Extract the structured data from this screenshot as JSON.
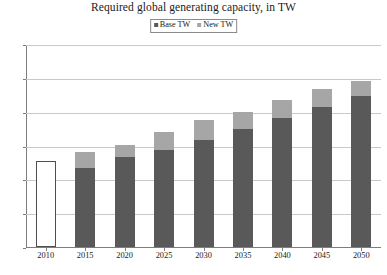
{
  "chart_data": {
    "type": "bar",
    "subtype": "stacked-column",
    "title": "Required global generating capacity, in TW",
    "xlabel": "",
    "ylabel": "",
    "ylim": [
      0,
      12
    ],
    "yticks": [
      0,
      2,
      4,
      6,
      8,
      10,
      12
    ],
    "ytick_labels": [
      "0",
      "2",
      "4",
      "6",
      "8",
      "10",
      "12"
    ],
    "grid": true,
    "legend_position": "top-center",
    "categories": [
      "2010",
      "2015",
      "2020",
      "2025",
      "2030",
      "2035",
      "2040",
      "2045",
      "2050"
    ],
    "series": [
      {
        "name": "Base TW",
        "color": "#595959",
        "values": [
          5.1,
          4.65,
          5.35,
          5.75,
          6.35,
          7.0,
          7.6,
          8.25,
          8.9
        ]
      },
      {
        "name": "New TW",
        "color": "#a6a6a6",
        "values": [
          0,
          0.95,
          0.7,
          1.05,
          1.15,
          1.0,
          1.1,
          1.1,
          0.9
        ]
      }
    ],
    "totals": [
      5.1,
      5.6,
      6.05,
      6.8,
      7.5,
      8.0,
      8.7,
      9.35,
      9.8
    ],
    "notes": {
      "first_bar_style": "outlined-white",
      "first_bar_outline_color": "#4f4f4f"
    }
  },
  "legend": {
    "entries": [
      {
        "label": "Base TW",
        "color": "#595959"
      },
      {
        "label": "New TW",
        "color": "#a6a6a6"
      }
    ]
  },
  "axis": {
    "gridline_color": "#c9c9c9",
    "axis_color": "#7d7d7d"
  }
}
